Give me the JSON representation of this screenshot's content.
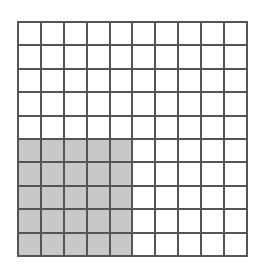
{
  "diagram": {
    "type": "hundred-grid",
    "rows": 10,
    "cols": 10,
    "shaded_block": {
      "row_start": 5,
      "row_end": 9,
      "col_start": 0,
      "col_end": 4
    },
    "shaded_count": 25,
    "total_count": 100,
    "colors": {
      "shaded": "#c8c8c8",
      "unshaded": "#ffffff",
      "lines": "#555555"
    }
  }
}
